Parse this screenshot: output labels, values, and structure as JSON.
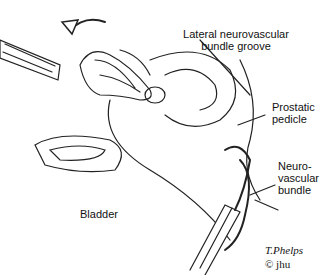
{
  "figure": {
    "labels": {
      "groove": [
        "Lateral neurovascular",
        "bundle groove"
      ],
      "pedicle": [
        "Prostatic",
        "pedicle"
      ],
      "nvb": [
        "Neuro-",
        "vascular",
        "bundle"
      ],
      "bladder": "Bladder"
    },
    "signature": "T.Phelps",
    "copyright": "© jhu"
  }
}
